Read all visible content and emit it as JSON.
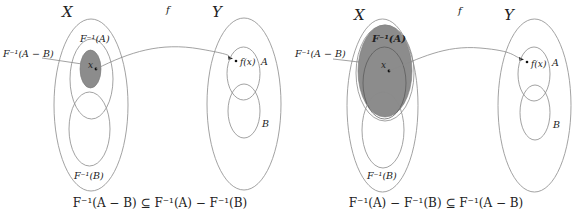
{
  "colors": {
    "shade": "#8c8c8c",
    "stroke": "#8a8a8a",
    "text": "#222222"
  },
  "function_label": "f",
  "panels": [
    {
      "id": "left",
      "domain_label": "X",
      "codomain_label": "Y",
      "labels": {
        "preimage_A": "F⁻¹(A)",
        "preimage_B": "F⁻¹(B)",
        "preimage_A_minus_B": "F⁻¹(A − B)",
        "point_x": "x",
        "point_fx": "f(x)",
        "set_A": "A",
        "set_B": "B"
      },
      "caption": "F⁻¹(A − B) ⊆ F⁻¹(A) − F⁻¹(B)",
      "shaded_region": "F⁻¹(A − B)"
    },
    {
      "id": "right",
      "domain_label": "X",
      "codomain_label": "Y",
      "labels": {
        "preimage_A": "F⁻¹(A)",
        "preimage_B": "F⁻¹(B)",
        "preimage_A_minus_B": "F⁻¹(A − B)",
        "point_x": "x",
        "point_fx": "f(x)",
        "set_A": "A",
        "set_B": "B"
      },
      "caption": "F⁻¹(A) − F⁻¹(B) ⊆ F⁻¹(A − B)",
      "shaded_region": "F⁻¹(A − B)"
    }
  ]
}
